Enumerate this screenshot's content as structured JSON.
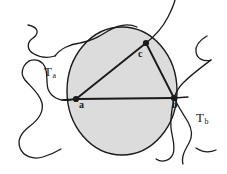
{
  "figure": {
    "background_color": "#ffffff",
    "stroke_color": "#1a1a1a",
    "disk_fill_color": "#dcdcdc",
    "width": 227,
    "height": 174
  },
  "labels": {
    "region_a": {
      "base": "T",
      "sub": "a"
    },
    "region_b": {
      "base": "T",
      "sub": "b"
    },
    "vertex_a": "a",
    "vertex_b": "b",
    "vertex_c": "c"
  },
  "geometry": {
    "circle": {
      "cx": 122,
      "cy": 91,
      "rx": 55,
      "ry": 64
    },
    "vertices": {
      "a": {
        "x": 76,
        "y": 99
      },
      "b": {
        "x": 174,
        "y": 98
      },
      "c": {
        "x": 146,
        "y": 43
      }
    },
    "triangle_edges": [
      {
        "from": "a",
        "to": "b"
      },
      {
        "from": "a",
        "to": "c"
      },
      {
        "from": "c",
        "to": "b"
      }
    ]
  }
}
